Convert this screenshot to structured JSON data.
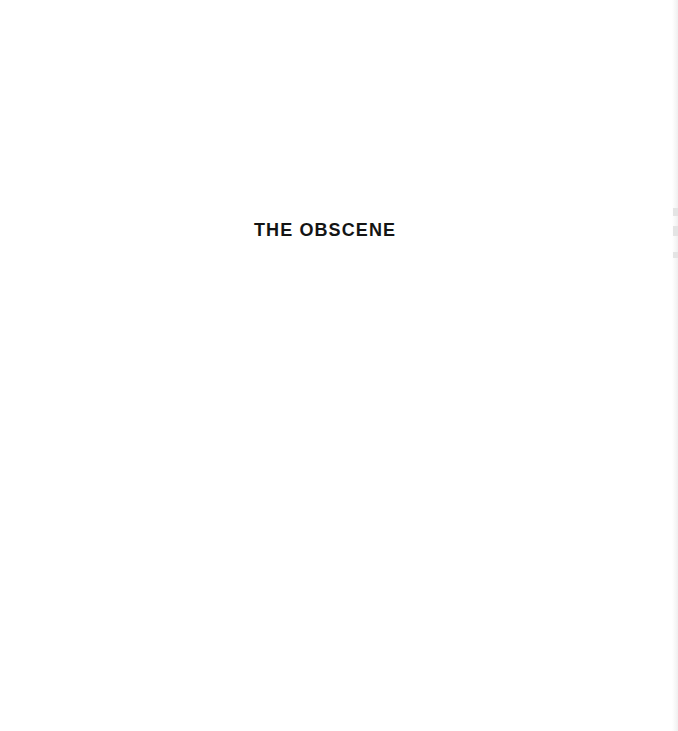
{
  "page": {
    "section_title": "THE OBSCENE",
    "background_color": "#ffffff",
    "text_color": "#141414"
  }
}
